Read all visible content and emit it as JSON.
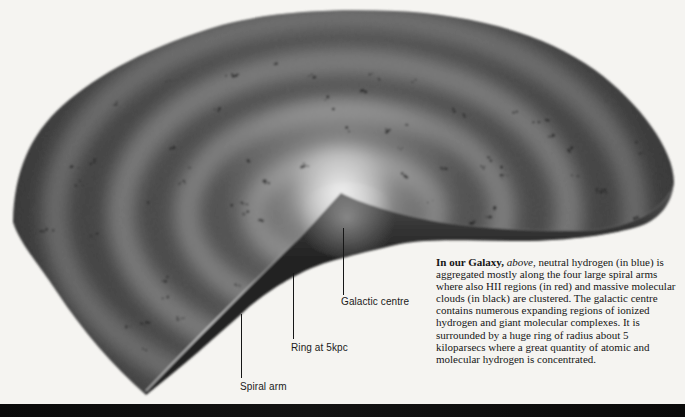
{
  "figure": {
    "labels": [
      {
        "id": "galactic-centre",
        "text": "Galactic centre"
      },
      {
        "id": "ring-at-5kpc",
        "text": "Ring at 5kpc"
      },
      {
        "id": "spiral-arm",
        "text": "Spiral arm"
      }
    ]
  },
  "caption": {
    "lead_bold": "In our Galaxy,",
    "lead_italic": " above",
    "body": ", neutral hydrogen (in blue) is aggregated mostly along the four large spiral arms where also HII regions (in red) and massive molecular clouds (in black) are clustered. The galactic centre contains numerous expanding regions of ionized hydrogen and giant molecular complexes. It is surrounded by a huge ring of radius about 5 kiloparsecs where a great quantity of atomic and molecular hydrogen is concentrated."
  },
  "colors": {
    "page_background": "#f5f4f1",
    "disc_dark": "#2e2e2e",
    "arm_band": "#a0a0a0",
    "centre_glow": "#ffffff",
    "ink": "#1a1a1a",
    "bottom_bar": "#0b0b0b"
  }
}
